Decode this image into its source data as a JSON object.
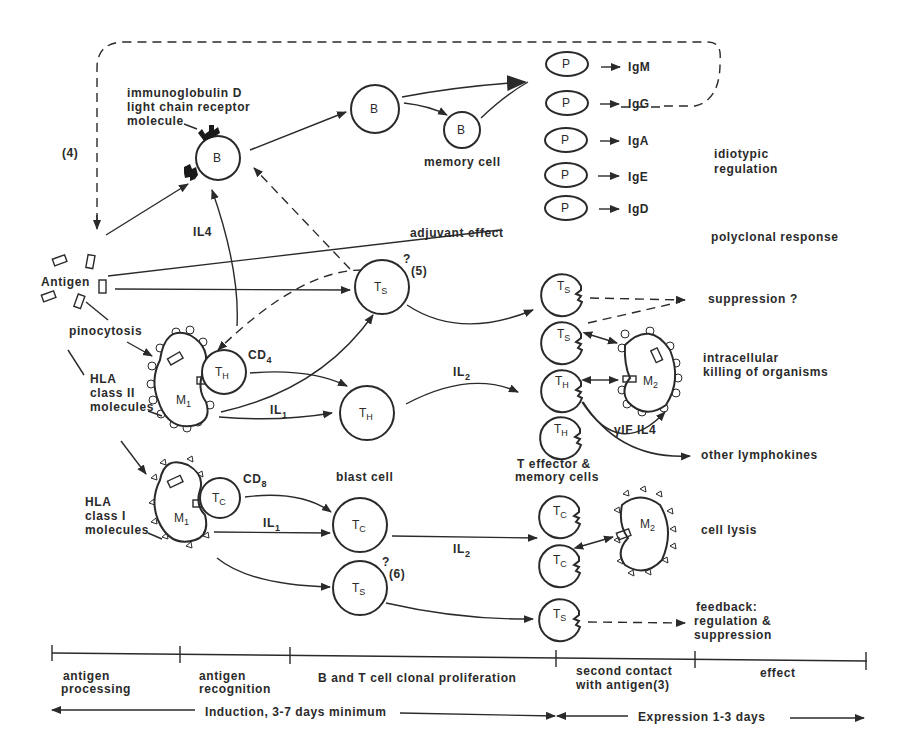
{
  "diagram": {
    "labels": {
      "igd_receptor_line1": "immunoglobulin D",
      "igd_receptor_line2": "light chain receptor",
      "igd_receptor_line3": "molecule",
      "ref4": "(4)",
      "memory_cell": "memory cell",
      "idiotypic_line1": "idiotypic",
      "idiotypic_line2": "regulation",
      "il4_top": "IL4",
      "adjuvant": "adjuvant effect",
      "polyclonal": "polyclonal response",
      "antigen": "Antigen",
      "ts_q5_q": "?",
      "ts_q5_ref": "(5)",
      "suppression": "suppression ?",
      "pinocytosis": "pinocytosis",
      "cd4": "CD",
      "cd4_sub": "4",
      "hla2_line1": "HLA",
      "hla2_line2": "class II",
      "hla2_line3": "molecules",
      "il1_upper": "IL",
      "il1_upper_sub": "1",
      "il2_upper": "IL",
      "il2_upper_sub": "2",
      "intracellular_line1": "intracellular",
      "intracellular_line2": "killing of organisms",
      "gif_il4": "γIF  IL4",
      "other_lymphokines": "other lymphokines",
      "blast_cell": "blast cell",
      "t_effector_line1": "T effector &",
      "t_effector_line2": "memory cells",
      "cd8": "CD",
      "cd8_sub": "8",
      "hla1_line1": "HLA",
      "hla1_line2": "class I",
      "hla1_line3": "molecules",
      "il1_lower": "IL",
      "il1_lower_sub": "1",
      "il2_lower": "IL",
      "il2_lower_sub": "2",
      "cell_lysis": "cell lysis",
      "ts_q6_q": "?",
      "ts_q6_ref": "(6)",
      "feedback_line1": "feedback:",
      "feedback_line2": "regulation &",
      "feedback_line3": "suppression"
    },
    "cells": {
      "b_naive": "B",
      "b_activated": "B",
      "b_memory": "B",
      "ts_upper": {
        "main": "T",
        "sub": "S"
      },
      "th_on_m1": {
        "main": "T",
        "sub": "H"
      },
      "m1_upper": {
        "main": "M",
        "sub": "1"
      },
      "th_blast": {
        "main": "T",
        "sub": "H"
      },
      "m1_lower": {
        "main": "M",
        "sub": "1"
      },
      "tc_on_m1": {
        "main": "T",
        "sub": "C"
      },
      "tc_blast": {
        "main": "T",
        "sub": "C"
      },
      "ts_lower": {
        "main": "T",
        "sub": "S"
      },
      "eff_ts1": {
        "main": "T",
        "sub": "S"
      },
      "eff_ts2": {
        "main": "T",
        "sub": "S"
      },
      "eff_th1": {
        "main": "T",
        "sub": "H"
      },
      "eff_th2": {
        "main": "T",
        "sub": "H"
      },
      "m2_upper": {
        "main": "M",
        "sub": "2"
      },
      "eff_tc1": {
        "main": "T",
        "sub": "C"
      },
      "eff_tc2": {
        "main": "T",
        "sub": "C"
      },
      "m2_lower": {
        "main": "M",
        "sub": "2"
      },
      "eff_ts3": {
        "main": "T",
        "sub": "S"
      }
    },
    "plasma_cells": [
      {
        "cell": "P",
        "product": "IgM"
      },
      {
        "cell": "P",
        "product": "IgG"
      },
      {
        "cell": "P",
        "product": "IgA"
      },
      {
        "cell": "P",
        "product": "IgE"
      },
      {
        "cell": "P",
        "product": "IgD"
      }
    ],
    "timeline": {
      "phases": [
        {
          "line1": "antigen",
          "line2": "processing"
        },
        {
          "line1": "antigen",
          "line2": "recognition"
        },
        {
          "line1": "B and T cell clonal proliferation",
          "line2": ""
        },
        {
          "line1": "second contact",
          "line2": "with antigen(3)"
        },
        {
          "line1": "effect",
          "line2": ""
        }
      ],
      "induction": "Induction, 3-7 days minimum",
      "expression": "Expression 1-3 days"
    }
  }
}
